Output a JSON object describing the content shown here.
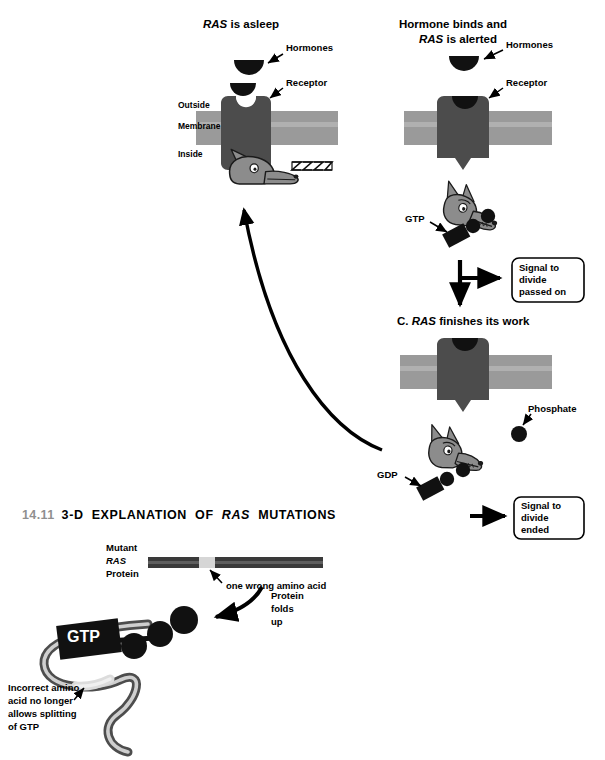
{
  "figure": {
    "number": "14.11",
    "title_parts": [
      "3-D  EXPLANATION  OF  ",
      "RAS",
      "  MUTATIONS"
    ],
    "title_plain": "14.11 3-D EXPLANATION OF RAS MUTATIONS"
  },
  "colors": {
    "membrane": "#9a9a9a",
    "membrane_light": "#b3b3b3",
    "receptor": "#4c4c4c",
    "dog_body": "#8c8c8c",
    "dog_outline": "#1a1a1a",
    "hormone": "#111111",
    "nucleotide": "#111111",
    "protein_bar_dark": "#3a3a3a",
    "protein_bar_mutant": "#d6d6d6",
    "chain_outer": "#4d4d4d",
    "chain_inner": "#cfcfcf",
    "text": "#000000",
    "fig_number": "#8f8f8f",
    "background": "#ffffff"
  },
  "panels": {
    "asleep": {
      "title_italic": "RAS",
      "title_rest": " is asleep",
      "labels": {
        "hormones": "Hormones",
        "receptor": "Receptor",
        "outside": "Outside",
        "membrane": "Membrane",
        "inside": "Inside",
        "snore": "ZZZZZZ!"
      }
    },
    "alerted": {
      "title_line1": "Hormone binds and",
      "title_line2_italic": "RAS",
      "title_line2_rest": " is alerted",
      "labels": {
        "hormones": "Hormones",
        "receptor": "Receptor",
        "gtp": "GTP"
      },
      "callout": {
        "line1": "Signal to",
        "line2": "divide",
        "line3": "passed on"
      }
    },
    "finishes": {
      "title_prefix": "C. ",
      "title_italic": "RAS",
      "title_rest": " finishes its work",
      "labels": {
        "phosphate": "Phosphate",
        "gdp": "GDP"
      },
      "callout": {
        "line1": "Signal to",
        "line2": "divide",
        "line3": "ended"
      }
    },
    "mutation": {
      "protein_label": {
        "line1": "Mutant",
        "line2_italic": "RAS",
        "line3": "Protein"
      },
      "amino_acid_note": "one wrong amino acid",
      "folds_note": {
        "line1": "Protein",
        "line2": "folds",
        "line3": "up"
      },
      "gtp_label": "GTP",
      "incorrect_note": {
        "line1": "Incorrect amino",
        "line2": "acid no longer",
        "line3": "allows splitting",
        "line4": "of GTP"
      }
    }
  }
}
